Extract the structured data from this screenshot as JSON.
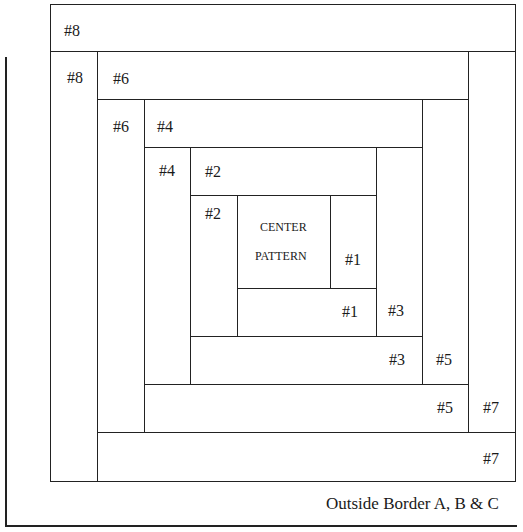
{
  "diagram": {
    "pieces": [
      {
        "id": "8-top",
        "label": "#8"
      },
      {
        "id": "8-left",
        "label": "#8"
      },
      {
        "id": "7-right",
        "label": "#7"
      },
      {
        "id": "7-bottom",
        "label": "#7"
      },
      {
        "id": "6-top",
        "label": "#6"
      },
      {
        "id": "6-left",
        "label": "#6"
      },
      {
        "id": "5-right",
        "label": "#5"
      },
      {
        "id": "5-bottom",
        "label": "#5"
      },
      {
        "id": "4-top",
        "label": "#4"
      },
      {
        "id": "4-left",
        "label": "#4"
      },
      {
        "id": "3-right",
        "label": "#3"
      },
      {
        "id": "3-bottom",
        "label": "#3"
      },
      {
        "id": "2-top",
        "label": "#2"
      },
      {
        "id": "2-left",
        "label": "#2"
      },
      {
        "id": "1-right",
        "label": "#1"
      },
      {
        "id": "1-bottom",
        "label": "#1"
      }
    ],
    "center": {
      "line1": "CENTER",
      "line2": "PATTERN"
    },
    "caption": "Outside Border A, B & C"
  }
}
